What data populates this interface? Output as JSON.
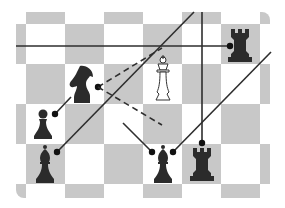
{
  "diagram": {
    "type": "chess-position-with-lines-of-attack",
    "colors": {
      "dark_square": "#c8c8c8",
      "light_square": "#ffffff",
      "black_piece": "#2b2b2b",
      "white_piece_outline": "#333333",
      "line": "#2e2e2e"
    },
    "board": {
      "left": 16,
      "top": 12,
      "width": 254,
      "height": 186,
      "square_w": 39,
      "square_h": 40,
      "grid_origin_x": -13,
      "grid_origin_y": -16,
      "cols": 8,
      "rows": 6
    },
    "pieces": [
      {
        "name": "black-rook-top-right",
        "type": "rook",
        "color": "black",
        "x": 240,
        "y": 45
      },
      {
        "name": "black-knight",
        "type": "knight",
        "color": "black",
        "x": 83,
        "y": 84
      },
      {
        "name": "white-king",
        "type": "king",
        "color": "white",
        "x": 163,
        "y": 80
      },
      {
        "name": "black-pawn",
        "type": "pawn",
        "color": "black",
        "x": 43,
        "y": 125
      },
      {
        "name": "black-bishop-left",
        "type": "bishop",
        "color": "black",
        "x": 45,
        "y": 165
      },
      {
        "name": "black-bishop-center",
        "type": "bishop",
        "color": "black",
        "x": 163,
        "y": 165
      },
      {
        "name": "black-rook-bottom",
        "type": "rook",
        "color": "black",
        "x": 202,
        "y": 164
      }
    ],
    "lines": [
      {
        "name": "rook-horizontal-line",
        "x1": 16,
        "y1": 46,
        "x2": 230,
        "y2": 46,
        "dashed": false,
        "dot": [
          230,
          46
        ]
      },
      {
        "name": "rook-vertical-line",
        "x1": 202,
        "y1": 12,
        "x2": 202,
        "y2": 143,
        "dashed": false,
        "dot": [
          202,
          143
        ]
      },
      {
        "name": "bishop-left-diagonal",
        "x1": 57,
        "y1": 152,
        "x2": 194,
        "y2": 12,
        "dashed": false,
        "dot": [
          57,
          152
        ]
      },
      {
        "name": "bishop-center-right-diagonal",
        "x1": 173,
        "y1": 152,
        "x2": 271,
        "y2": 52,
        "dashed": false,
        "dot": [
          173,
          152
        ]
      },
      {
        "name": "bishop-center-left-diagonal",
        "x1": 152,
        "y1": 152,
        "x2": 123,
        "y2": 123,
        "dashed": false,
        "dot": [
          152,
          152
        ]
      },
      {
        "name": "pawn-attack-line",
        "x1": 55,
        "y1": 114,
        "x2": 71,
        "y2": 97,
        "dashed": false,
        "dot": [
          55,
          114
        ]
      },
      {
        "name": "knight-dashed-up",
        "x1": 98,
        "y1": 87,
        "x2": 162,
        "y2": 48,
        "dashed": true,
        "dot": [
          98,
          87
        ]
      },
      {
        "name": "knight-dashed-down",
        "x1": 98,
        "y1": 87,
        "x2": 162,
        "y2": 125,
        "dashed": true,
        "dot": null
      }
    ]
  }
}
